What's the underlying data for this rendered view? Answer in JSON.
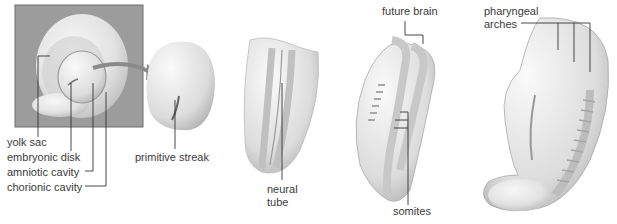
{
  "diagram": {
    "stages": [
      {
        "name": "stage-1-implanted-disk",
        "labels": [
          "yolk sac",
          "embryonic disk",
          "amniotic cavity",
          "chorionic cavity"
        ]
      },
      {
        "name": "stage-2-disk",
        "labels": [
          "primitive streak"
        ]
      },
      {
        "name": "stage-3-neural-folds",
        "labels": [
          "neural",
          "tube"
        ]
      },
      {
        "name": "stage-4-somites",
        "labels": [
          "future brain",
          "somites"
        ]
      },
      {
        "name": "stage-5-curved-embryo",
        "labels": [
          "pharyngeal",
          "arches"
        ]
      }
    ],
    "labels": {
      "yolk_sac": "yolk sac",
      "embryonic_disk": "embryonic disk",
      "amniotic_cavity": "amniotic cavity",
      "chorionic_cavity": "chorionic cavity",
      "primitive_streak": "primitive streak",
      "neural_line1": "neural",
      "neural_line2": "tube",
      "future_brain": "future brain",
      "somites": "somites",
      "pharyngeal_line1": "pharyngeal",
      "pharyngeal_line2": "arches"
    },
    "colors": {
      "box_bg": "#9c9c9c",
      "tissue": "#e6e6e6",
      "tissue_shadow": "#bdbdbd",
      "leader_line": "#333333",
      "arrow": "#8a8a8a"
    }
  }
}
